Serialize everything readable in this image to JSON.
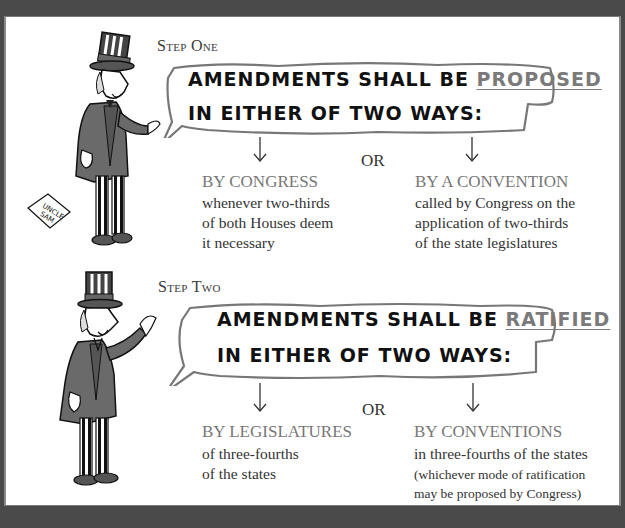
{
  "steps": [
    {
      "label": "Step One",
      "bubble": {
        "line1_prefix": "AMENDMENTS SHALL BE ",
        "line1_keyword": "PROPOSED",
        "line2": "IN EITHER OF TWO WAYS:"
      },
      "connector": "OR",
      "options": [
        {
          "title": "BY CONGRESS",
          "description": "whenever two-thirds\nof  both Houses deem\nit necessary"
        },
        {
          "title": "BY A CONVENTION",
          "description": "called by Congress on the\napplication of two-thirds\nof the state legislatures"
        }
      ],
      "figure": {
        "name": "Uncle Sam",
        "sign_text": "UNCLE SAM"
      }
    },
    {
      "label": "Step Two",
      "bubble": {
        "line1_prefix": "AMENDMENTS SHALL BE ",
        "line1_keyword": "RATIFIED",
        "line2": "IN EITHER OF TWO WAYS:"
      },
      "connector": "OR",
      "options": [
        {
          "title": "BY LEGISLATURES",
          "description": "of three-fourths\nof the states"
        },
        {
          "title": "BY  CONVENTIONS",
          "description": "in three-fourths of the states",
          "note": "(whichever mode of ratification\nmay be proposed by Congress)"
        }
      ],
      "figure": {
        "name": "Uncle Sam"
      }
    }
  ],
  "colors": {
    "frame": "#4a4a4a",
    "panel": "#ffffff",
    "highlight": "#7a7a7a",
    "option_title": "#777777",
    "body_text": "#333333"
  }
}
